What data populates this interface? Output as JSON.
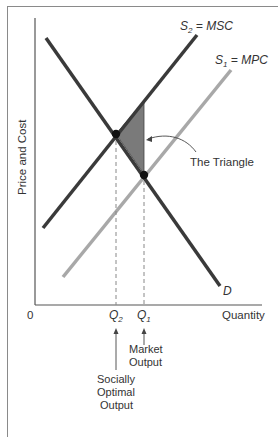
{
  "figure": {
    "y_axis_label": "Price and Cost",
    "x_axis_label": "Quantity",
    "origin_label": "0",
    "curves": {
      "msc": {
        "name": "S",
        "sub": "2",
        "eq": " = MSC",
        "color": "#3a3a3a"
      },
      "mpc": {
        "name": "S",
        "sub": "1",
        "eq": " = MPC",
        "color": "#a8a8a8"
      },
      "demand": {
        "name": "D",
        "color": "#3a3a3a"
      }
    },
    "triangle": {
      "label": "The Triangle",
      "fill": "#7a7a7a"
    },
    "quantities": {
      "q2": {
        "name": "Q",
        "sub": "2"
      },
      "q1": {
        "name": "Q",
        "sub": "1"
      }
    },
    "annotations": {
      "market_output": [
        "Market",
        "Output"
      ],
      "socially_optimal_output": [
        "Socially",
        "Optimal",
        "Output"
      ]
    }
  }
}
